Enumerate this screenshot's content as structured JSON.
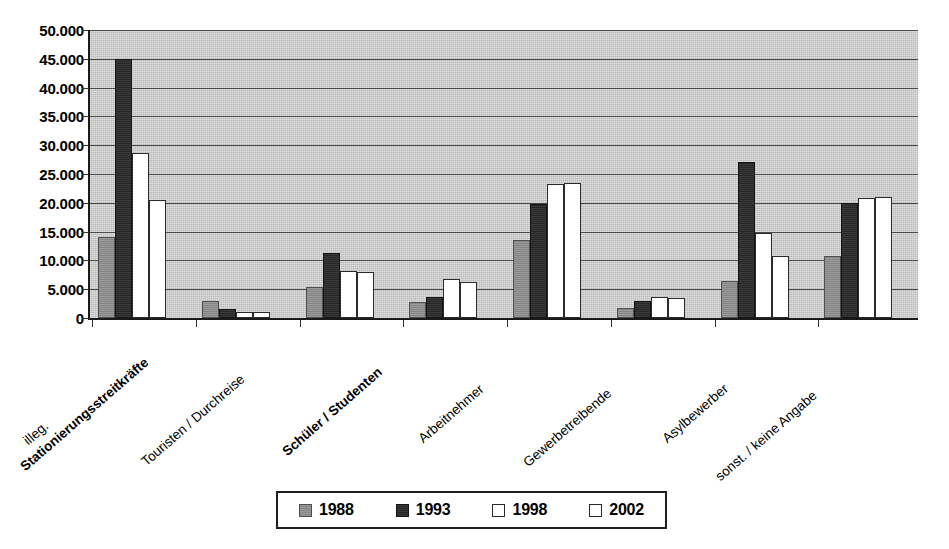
{
  "chart_data": {
    "type": "bar",
    "title": "",
    "subtitle": "",
    "xlabel": "",
    "ylabel": "",
    "ylim": [
      0,
      50000
    ],
    "ytick_step": 5000,
    "grid": true,
    "legend_position": "bottom",
    "number_format": "German (period as thousands separator)",
    "ytick_labels": [
      "0",
      "5.000",
      "10.000",
      "15.000",
      "20.000",
      "25.000",
      "30.000",
      "35.000",
      "40.000",
      "45.000",
      "50.000"
    ],
    "ytick_values": [
      0,
      5000,
      10000,
      15000,
      20000,
      25000,
      30000,
      35000,
      40000,
      45000,
      50000
    ],
    "categories": [
      "illeg.",
      "Stationierungsstreitkräfte",
      "Touristen / Durchreise",
      "Schüler / Studenten",
      "Arbeitnehmer",
      "Gewerbetreibende",
      "Asylbewerber",
      "sonst. / keine Angabe"
    ],
    "series": [
      {
        "name": "1988",
        "color": "#8e8e8e",
        "values": [
          14000,
          3000,
          5300,
          2800,
          13500,
          1800,
          6500,
          10700
        ]
      },
      {
        "name": "1993",
        "color": "#2b2b2b",
        "values": [
          45000,
          1500,
          11300,
          3600,
          19800,
          2900,
          27000,
          19900
        ]
      },
      {
        "name": "1998",
        "color": "#ffffff",
        "values": [
          28700,
          1000,
          8200,
          6700,
          23300,
          3600,
          14700,
          20800
        ]
      },
      {
        "name": "2002",
        "color": "#ffffff",
        "values": [
          20500,
          1000,
          8000,
          6300,
          23500,
          3400,
          10700,
          21000
        ]
      }
    ]
  },
  "legend": {
    "items": [
      {
        "label": "1988",
        "series_class": "s1988"
      },
      {
        "label": "1993",
        "series_class": "s1993"
      },
      {
        "label": "1998",
        "series_class": "s1998"
      },
      {
        "label": "2002",
        "series_class": "s2002"
      }
    ]
  },
  "colors": {
    "plot_background": "#cdcdcd",
    "gridline": "#4a4a4a",
    "axis": "#1a1a1a",
    "page_background": "#ffffff",
    "text": "#000000"
  }
}
